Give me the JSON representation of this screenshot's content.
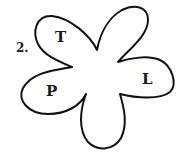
{
  "diagram": {
    "number_label": "2.",
    "shape": "five-petal flower outline",
    "stroke_color": "#111111",
    "background_color": "#ffffff",
    "petals": [
      {
        "position": "top-left",
        "letter": "T"
      },
      {
        "position": "top-right",
        "letter": ""
      },
      {
        "position": "right",
        "letter": "L"
      },
      {
        "position": "bottom",
        "letter": ""
      },
      {
        "position": "left",
        "letter": "P"
      }
    ]
  }
}
